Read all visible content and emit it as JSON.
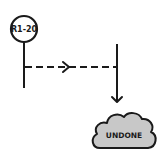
{
  "diagram": {
    "commit_node": {
      "label": "R1-20",
      "shape": "circle"
    },
    "cloud_node": {
      "label": "UNDONE",
      "fill": "#c8c8c8",
      "stroke": "#1a1a1a"
    },
    "edges": [
      {
        "from": "commit-branch",
        "to": "right-branch",
        "style": "dashed",
        "arrow": "right"
      },
      {
        "from": "right-branch",
        "to": "cloud",
        "style": "solid",
        "arrow": "down"
      }
    ],
    "colors": {
      "ink": "#1a1a1a",
      "background": "#ffffff",
      "cloud_fill": "#c8c8c8"
    }
  }
}
